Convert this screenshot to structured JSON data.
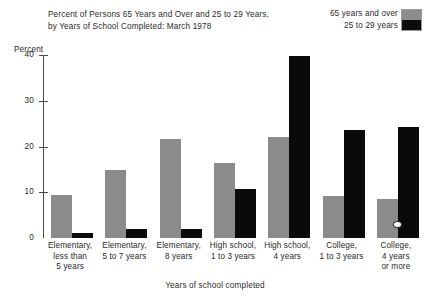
{
  "title": {
    "line1": "Percent of Persons 65 Years and Over and 25 to 29 Years,",
    "line2": "by Years of School Completed:  March 1978"
  },
  "legend": {
    "position": "top-right",
    "entries": [
      {
        "label": "65 years and over",
        "color": "#8b8b8b"
      },
      {
        "label": "25 to 29 years",
        "color": "#0a0a0a"
      }
    ]
  },
  "axes": {
    "ylabel": "Percent",
    "xlabel": "Years of school completed",
    "yticks": [
      "0",
      "10",
      "20",
      "30",
      "40"
    ]
  },
  "chart_data": {
    "type": "bar",
    "title": "Percent of Persons 65 Years and Over and 25 to 29 Years, by Years of School Completed:  March 1978",
    "subtitle": "",
    "xlabel": "Years of school completed",
    "ylabel": "Percent",
    "ylim": [
      0,
      40
    ],
    "yticks": [
      0,
      10,
      20,
      30,
      40
    ],
    "grid": false,
    "legend_position": "top-right",
    "categories": [
      "Elementary, less than 5 years",
      "Elementary, 5 to 7 years",
      "Elementary, 8 years",
      "High school, 1 to 3 years",
      "High school, 4 years",
      "College, 1 to 3 years",
      "College, 4 years or more"
    ],
    "category_lines": [
      [
        "Elementary,",
        "less than",
        "5 years"
      ],
      [
        "Elementary,",
        "5 to 7 years"
      ],
      [
        "Elementary,",
        "8 years"
      ],
      [
        "High school,",
        "1 to 3 years"
      ],
      [
        "High school,",
        "4 years"
      ],
      [
        "College,",
        "1 to 3 years"
      ],
      [
        "College,",
        "4 years",
        "or more"
      ]
    ],
    "series": [
      {
        "name": "65 years and over",
        "color": "#8b8b8b",
        "values": [
          9.5,
          14.8,
          21.7,
          16.3,
          22.0,
          9.2,
          8.6
        ]
      },
      {
        "name": "25 to 29 years",
        "color": "#0a0a0a",
        "values": [
          1.0,
          2.0,
          2.0,
          10.7,
          39.8,
          23.7,
          24.2
        ]
      }
    ]
  }
}
